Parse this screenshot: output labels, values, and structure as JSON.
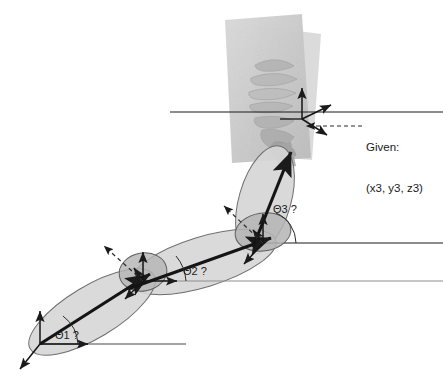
{
  "figure": {
    "background_color": "#ffffff",
    "stroke_color": "#1a1a1a",
    "link_fill_color": "#d6d6d6",
    "link_stroke_color": "#555555",
    "joint_fill_color": "#b9b9b9",
    "photo_fill_color": "#d0d0d0",
    "photo_fill_color_2": "#c4c4c4"
  },
  "labels": {
    "theta1": "Θ1 ?",
    "theta2": "Θ2 ?",
    "theta3": "Θ3 ?",
    "given_title": "Given:",
    "given_value": "(x3, y3, z3)"
  },
  "joints": [
    {
      "id": "joint1",
      "label": "Θ1 ?",
      "x": 40,
      "y": 344,
      "frame_axes": [
        "up",
        "right",
        "down-left"
      ]
    },
    {
      "id": "joint2",
      "label": "Θ2 ?",
      "x": 143,
      "y": 281,
      "frame_axes": [
        "up",
        "up-left",
        "down-left"
      ]
    },
    {
      "id": "joint3",
      "label": "Θ3 ?",
      "x": 263,
      "y": 243,
      "frame_axes": [
        "up",
        "up-left",
        "down-left"
      ]
    },
    {
      "id": "end-effector",
      "label": "(x3, y3, z3)",
      "x": 302,
      "y": 119,
      "frame_axes": [
        "up",
        "up-right",
        "down-right"
      ]
    }
  ],
  "reference_lines": [
    {
      "id": "ref-line-base",
      "x1": 40,
      "y1": 344,
      "x2": 185,
      "y2": 344
    },
    {
      "id": "ref-line-joint2",
      "x1": 143,
      "y1": 281,
      "x2": 443,
      "y2": 281
    },
    {
      "id": "ref-line-joint3",
      "x1": 263,
      "y1": 243,
      "x2": 443,
      "y2": 243
    },
    {
      "id": "ref-line-endeffector",
      "x1": 170,
      "y1": 112,
      "x2": 443,
      "y2": 112
    }
  ],
  "links": [
    {
      "id": "link1",
      "from": "joint1",
      "to": "joint2"
    },
    {
      "id": "link2",
      "from": "joint2",
      "to": "joint3"
    },
    {
      "id": "link3",
      "from": "joint3",
      "to": "end-effector"
    }
  ]
}
